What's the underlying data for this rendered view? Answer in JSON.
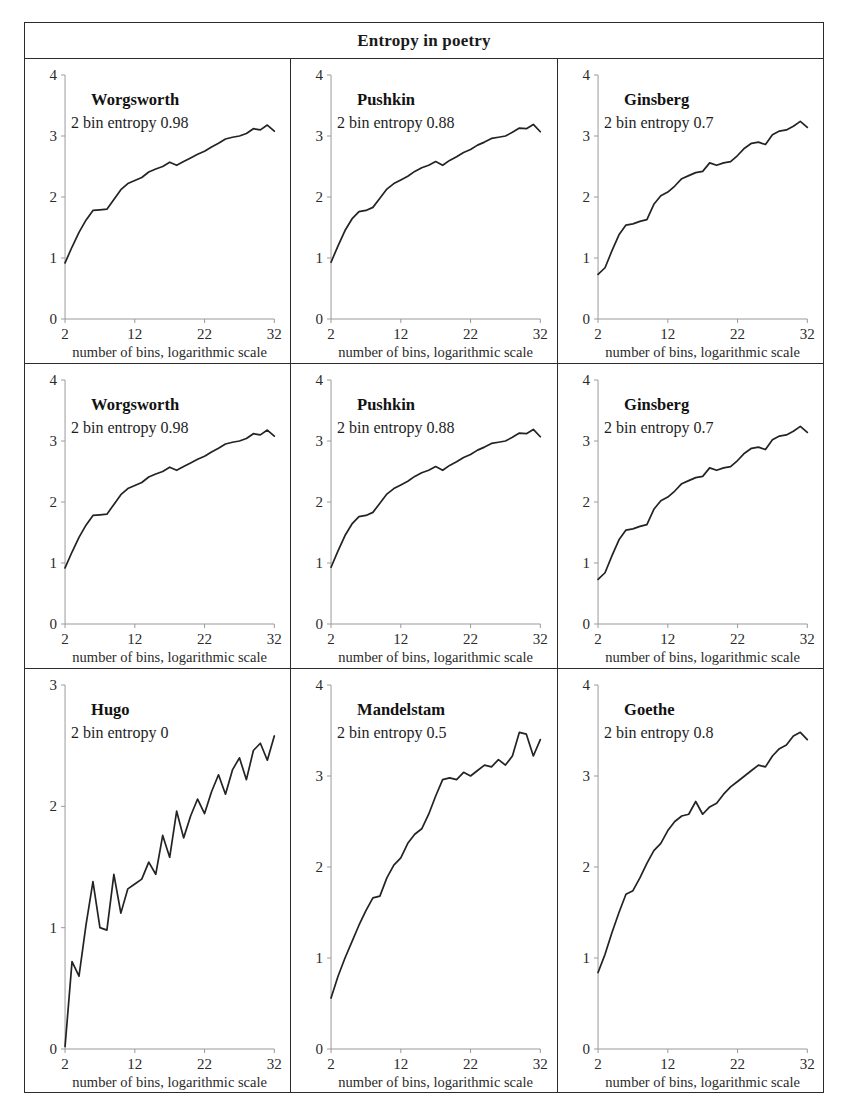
{
  "figure": {
    "title": "Entropy in poetry",
    "rows": 3,
    "cols": 3
  },
  "axis": {
    "x_caption": "number of bins, logarithmic scale",
    "x_ticks": [
      "2",
      "12",
      "22",
      "32"
    ],
    "x_tick_values": [
      2,
      12,
      22,
      32
    ],
    "y_ticks_4": [
      "0",
      "1",
      "2",
      "3",
      "4"
    ],
    "y_ticks_3": [
      "0",
      "1",
      "2",
      "3"
    ]
  },
  "chart_data": [
    {
      "type": "line",
      "panel": 1,
      "row": 1,
      "col": 1,
      "title": "Worgsworth",
      "annotation": "2 bin entropy 0.98",
      "entropy_2bin": 0.98,
      "xlabel": "number of bins, logarithmic scale",
      "ylabel": "",
      "xlim": [
        2,
        32
      ],
      "ylim": [
        0,
        4
      ],
      "xticks": [
        2,
        12,
        22,
        32
      ],
      "yticks": [
        0,
        1,
        2,
        3,
        4
      ],
      "grid": false,
      "legend": "none",
      "x": [
        2,
        3,
        4,
        5,
        6,
        7,
        8,
        9,
        10,
        11,
        12,
        13,
        14,
        15,
        16,
        17,
        18,
        19,
        20,
        21,
        22,
        23,
        24,
        25,
        26,
        27,
        28,
        29,
        30,
        31,
        32
      ],
      "values": [
        0.92,
        1.18,
        1.42,
        1.62,
        1.78,
        1.79,
        1.8,
        1.96,
        2.12,
        2.22,
        2.27,
        2.32,
        2.41,
        2.46,
        2.5,
        2.57,
        2.52,
        2.58,
        2.64,
        2.7,
        2.75,
        2.82,
        2.88,
        2.95,
        2.98,
        3.0,
        3.04,
        3.12,
        3.1,
        3.18,
        3.08
      ]
    },
    {
      "type": "line",
      "panel": 2,
      "row": 1,
      "col": 2,
      "title": "Pushkin",
      "annotation": "2 bin entropy 0.88",
      "entropy_2bin": 0.88,
      "xlabel": "number of bins, logarithmic scale",
      "ylabel": "",
      "xlim": [
        2,
        32
      ],
      "ylim": [
        0,
        4
      ],
      "xticks": [
        2,
        12,
        22,
        32
      ],
      "yticks": [
        0,
        1,
        2,
        3,
        4
      ],
      "grid": false,
      "legend": "none",
      "x": [
        2,
        3,
        4,
        5,
        6,
        7,
        8,
        9,
        10,
        11,
        12,
        13,
        14,
        15,
        16,
        17,
        18,
        19,
        20,
        21,
        22,
        23,
        24,
        25,
        26,
        27,
        28,
        29,
        30,
        31,
        32
      ],
      "values": [
        0.93,
        1.2,
        1.45,
        1.64,
        1.76,
        1.78,
        1.83,
        1.98,
        2.13,
        2.22,
        2.28,
        2.34,
        2.42,
        2.48,
        2.52,
        2.58,
        2.52,
        2.6,
        2.66,
        2.73,
        2.78,
        2.85,
        2.9,
        2.96,
        2.98,
        3.0,
        3.06,
        3.13,
        3.12,
        3.19,
        3.07
      ]
    },
    {
      "type": "line",
      "panel": 3,
      "row": 1,
      "col": 3,
      "title": "Ginsberg",
      "annotation": "2 bin entropy 0.7",
      "entropy_2bin": 0.7,
      "xlabel": "number of bins, logarithmic scale",
      "ylabel": "",
      "xlim": [
        2,
        32
      ],
      "ylim": [
        0,
        4
      ],
      "xticks": [
        2,
        12,
        22,
        32
      ],
      "yticks": [
        0,
        1,
        2,
        3,
        4
      ],
      "grid": false,
      "legend": "none",
      "x": [
        2,
        3,
        4,
        5,
        6,
        7,
        8,
        9,
        10,
        11,
        12,
        13,
        14,
        15,
        16,
        17,
        18,
        19,
        20,
        21,
        22,
        23,
        24,
        25,
        26,
        27,
        28,
        29,
        30,
        31,
        32
      ],
      "values": [
        0.73,
        0.84,
        1.12,
        1.38,
        1.54,
        1.56,
        1.6,
        1.63,
        1.88,
        2.02,
        2.08,
        2.18,
        2.3,
        2.35,
        2.4,
        2.42,
        2.56,
        2.52,
        2.56,
        2.58,
        2.68,
        2.8,
        2.88,
        2.9,
        2.86,
        3.02,
        3.08,
        3.1,
        3.16,
        3.24,
        3.14
      ]
    },
    {
      "type": "line",
      "panel": 4,
      "row": 2,
      "col": 1,
      "title": "Worgsworth",
      "annotation": "2 bin entropy 0.98",
      "entropy_2bin": 0.98,
      "xlabel": "number of bins, logarithmic scale",
      "ylabel": "",
      "xlim": [
        2,
        32
      ],
      "ylim": [
        0,
        4
      ],
      "xticks": [
        2,
        12,
        22,
        32
      ],
      "yticks": [
        0,
        1,
        2,
        3,
        4
      ],
      "grid": false,
      "legend": "none",
      "x": [
        2,
        3,
        4,
        5,
        6,
        7,
        8,
        9,
        10,
        11,
        12,
        13,
        14,
        15,
        16,
        17,
        18,
        19,
        20,
        21,
        22,
        23,
        24,
        25,
        26,
        27,
        28,
        29,
        30,
        31,
        32
      ],
      "values": [
        0.92,
        1.18,
        1.42,
        1.62,
        1.78,
        1.79,
        1.8,
        1.96,
        2.12,
        2.22,
        2.27,
        2.32,
        2.41,
        2.46,
        2.5,
        2.57,
        2.52,
        2.58,
        2.64,
        2.7,
        2.75,
        2.82,
        2.88,
        2.95,
        2.98,
        3.0,
        3.04,
        3.12,
        3.1,
        3.18,
        3.08
      ]
    },
    {
      "type": "line",
      "panel": 5,
      "row": 2,
      "col": 2,
      "title": "Pushkin",
      "annotation": "2 bin entropy 0.88",
      "entropy_2bin": 0.88,
      "xlabel": "number of bins, logarithmic scale",
      "ylabel": "",
      "xlim": [
        2,
        32
      ],
      "ylim": [
        0,
        4
      ],
      "xticks": [
        2,
        12,
        22,
        32
      ],
      "yticks": [
        0,
        1,
        2,
        3,
        4
      ],
      "grid": false,
      "legend": "none",
      "x": [
        2,
        3,
        4,
        5,
        6,
        7,
        8,
        9,
        10,
        11,
        12,
        13,
        14,
        15,
        16,
        17,
        18,
        19,
        20,
        21,
        22,
        23,
        24,
        25,
        26,
        27,
        28,
        29,
        30,
        31,
        32
      ],
      "values": [
        0.93,
        1.2,
        1.45,
        1.64,
        1.76,
        1.78,
        1.83,
        1.98,
        2.13,
        2.22,
        2.28,
        2.34,
        2.42,
        2.48,
        2.52,
        2.58,
        2.52,
        2.6,
        2.66,
        2.73,
        2.78,
        2.85,
        2.9,
        2.96,
        2.98,
        3.0,
        3.06,
        3.13,
        3.12,
        3.19,
        3.07
      ]
    },
    {
      "type": "line",
      "panel": 6,
      "row": 2,
      "col": 3,
      "title": "Ginsberg",
      "annotation": "2 bin entropy 0.7",
      "entropy_2bin": 0.7,
      "xlabel": "number of bins, logarithmic scale",
      "ylabel": "",
      "xlim": [
        2,
        32
      ],
      "ylim": [
        0,
        4
      ],
      "xticks": [
        2,
        12,
        22,
        32
      ],
      "yticks": [
        0,
        1,
        2,
        3,
        4
      ],
      "grid": false,
      "legend": "none",
      "x": [
        2,
        3,
        4,
        5,
        6,
        7,
        8,
        9,
        10,
        11,
        12,
        13,
        14,
        15,
        16,
        17,
        18,
        19,
        20,
        21,
        22,
        23,
        24,
        25,
        26,
        27,
        28,
        29,
        30,
        31,
        32
      ],
      "values": [
        0.73,
        0.84,
        1.12,
        1.38,
        1.54,
        1.56,
        1.6,
        1.63,
        1.88,
        2.02,
        2.08,
        2.18,
        2.3,
        2.35,
        2.4,
        2.42,
        2.56,
        2.52,
        2.56,
        2.58,
        2.68,
        2.8,
        2.88,
        2.9,
        2.86,
        3.02,
        3.08,
        3.1,
        3.16,
        3.24,
        3.14
      ]
    },
    {
      "type": "line",
      "panel": 7,
      "row": 3,
      "col": 1,
      "title": "Hugo",
      "annotation": "2 bin entropy 0",
      "entropy_2bin": 0,
      "xlabel": "number of bins, logarithmic scale",
      "ylabel": "",
      "xlim": [
        2,
        32
      ],
      "ylim": [
        0,
        3
      ],
      "xticks": [
        2,
        12,
        22,
        32
      ],
      "yticks": [
        0,
        1,
        2,
        3
      ],
      "grid": false,
      "legend": "none",
      "x": [
        2,
        3,
        4,
        5,
        6,
        7,
        8,
        9,
        10,
        11,
        12,
        13,
        14,
        15,
        16,
        17,
        18,
        19,
        20,
        21,
        22,
        23,
        24,
        25,
        26,
        27,
        28,
        29,
        30,
        31,
        32
      ],
      "values": [
        0.02,
        0.72,
        0.6,
        1.02,
        1.38,
        1.0,
        0.98,
        1.44,
        1.12,
        1.32,
        1.36,
        1.4,
        1.54,
        1.44,
        1.76,
        1.58,
        1.96,
        1.74,
        1.92,
        2.06,
        1.94,
        2.12,
        2.26,
        2.1,
        2.3,
        2.4,
        2.22,
        2.46,
        2.52,
        2.38,
        2.58
      ]
    },
    {
      "type": "line",
      "panel": 8,
      "row": 3,
      "col": 2,
      "title": "Mandelstam",
      "annotation": "2 bin entropy 0.5",
      "entropy_2bin": 0.5,
      "xlabel": "number of bins, logarithmic scale",
      "ylabel": "",
      "xlim": [
        2,
        32
      ],
      "ylim": [
        0,
        4
      ],
      "xticks": [
        2,
        12,
        22,
        32
      ],
      "yticks": [
        0,
        1,
        2,
        3,
        4
      ],
      "grid": false,
      "legend": "none",
      "x": [
        2,
        3,
        4,
        5,
        6,
        7,
        8,
        9,
        10,
        11,
        12,
        13,
        14,
        15,
        16,
        17,
        18,
        19,
        20,
        21,
        22,
        23,
        24,
        25,
        26,
        27,
        28,
        29,
        30,
        31,
        32
      ],
      "values": [
        0.56,
        0.8,
        1.0,
        1.18,
        1.36,
        1.52,
        1.66,
        1.68,
        1.88,
        2.02,
        2.1,
        2.26,
        2.36,
        2.42,
        2.58,
        2.78,
        2.96,
        2.98,
        2.96,
        3.04,
        3.0,
        3.06,
        3.12,
        3.1,
        3.18,
        3.12,
        3.22,
        3.48,
        3.46,
        3.22,
        3.4
      ]
    },
    {
      "type": "line",
      "panel": 9,
      "row": 3,
      "col": 3,
      "title": "Goethe",
      "annotation": "2 bin entropy 0.8",
      "entropy_2bin": 0.8,
      "xlabel": "number of bins, logarithmic scale",
      "ylabel": "",
      "xlim": [
        2,
        32
      ],
      "ylim": [
        0,
        4
      ],
      "xticks": [
        2,
        12,
        22,
        32
      ],
      "yticks": [
        0,
        1,
        2,
        3,
        4
      ],
      "grid": false,
      "legend": "none",
      "x": [
        2,
        3,
        4,
        5,
        6,
        7,
        8,
        9,
        10,
        11,
        12,
        13,
        14,
        15,
        16,
        17,
        18,
        19,
        20,
        21,
        22,
        23,
        24,
        25,
        26,
        27,
        28,
        29,
        30,
        31,
        32
      ],
      "values": [
        0.84,
        1.04,
        1.28,
        1.5,
        1.7,
        1.74,
        1.88,
        2.04,
        2.18,
        2.26,
        2.4,
        2.5,
        2.56,
        2.58,
        2.72,
        2.58,
        2.66,
        2.7,
        2.8,
        2.88,
        2.94,
        3.0,
        3.06,
        3.12,
        3.1,
        3.22,
        3.3,
        3.34,
        3.44,
        3.48,
        3.4
      ]
    }
  ]
}
